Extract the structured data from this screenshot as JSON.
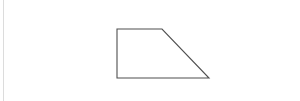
{
  "canvas": {
    "width": 300,
    "height": 101,
    "background_color": "#ffffff",
    "title": "Right trapezoid outline figure"
  },
  "margin_rule": {
    "name": "left margin rule",
    "x": 3.5,
    "y1": 0,
    "y2": 101,
    "color": "#dcdcdc",
    "stroke_width": 1
  },
  "figure": {
    "name": "right trapezoid",
    "shape_type": "trapezoid",
    "stroke_color": "#4f4f4f",
    "stroke_width": 1.1,
    "fill": "none",
    "points": "117,29 162,29 209,78 117,78",
    "vertices": [
      {
        "label": "top-left",
        "x": 117,
        "y": 29
      },
      {
        "label": "top-right",
        "x": 162,
        "y": 29
      },
      {
        "label": "bottom-right",
        "x": 209,
        "y": 78
      },
      {
        "label": "bottom-left",
        "x": 117,
        "y": 78
      }
    ],
    "edges": [
      {
        "name": "top-edge",
        "x1": 117,
        "y1": 29,
        "x2": 162,
        "y2": 29,
        "orientation": "horizontal",
        "length": 45
      },
      {
        "name": "right-diagonal-edge",
        "x1": 162,
        "y1": 29,
        "x2": 209,
        "y2": 78,
        "orientation": "diagonal",
        "length": 68
      },
      {
        "name": "bottom-edge",
        "x1": 209,
        "y1": 78,
        "x2": 117,
        "y2": 78,
        "orientation": "horizontal",
        "length": 92
      },
      {
        "name": "left-edge",
        "x1": 117,
        "y1": 78,
        "x2": 117,
        "y2": 29,
        "orientation": "vertical",
        "length": 49
      }
    ]
  },
  "chart_data": {
    "type": "scatter",
    "title": "Right trapezoid outline",
    "xlabel": "",
    "ylabel": "",
    "x": [
      117,
      162,
      209,
      117
    ],
    "y": [
      29,
      29,
      78,
      78
    ],
    "series": [
      {
        "name": "trapezoid-outline",
        "values": [
          29,
          29,
          78,
          78
        ]
      }
    ],
    "categories": [
      "top-left",
      "top-right",
      "bottom-right",
      "bottom-left"
    ],
    "xlim": [
      0,
      300
    ],
    "ylim": [
      0,
      101
    ],
    "grid": false,
    "legend": "none"
  }
}
